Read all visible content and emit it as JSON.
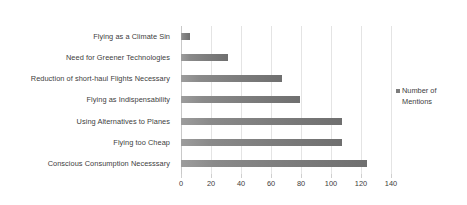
{
  "chart_data": {
    "type": "bar",
    "orientation": "horizontal",
    "title": "",
    "xlabel": "",
    "ylabel": "",
    "xlim": [
      0,
      140
    ],
    "xticks": [
      0,
      20,
      40,
      60,
      80,
      100,
      120,
      140
    ],
    "grid": true,
    "legend_position": "right",
    "categories": [
      "Flying as a Climate Sin",
      "Need for Greener Technologies",
      "Reduction of short-haul Flights Necessary",
      "Flying as Indispensability",
      "Using Alternatives to Planes",
      "Flying too Cheap",
      "Conscious Consumption Necesssary"
    ],
    "series": [
      {
        "name": "Number of Mentions",
        "color": "#7d7d7d",
        "values": [
          6,
          31,
          67,
          79,
          107,
          107,
          124
        ]
      }
    ]
  },
  "legend": {
    "entries": [
      {
        "label": "Number of Mentions",
        "color": "#7d7d7d",
        "marker": "square-marker"
      }
    ]
  },
  "axis": {
    "tick_labels": [
      "0",
      "20",
      "40",
      "60",
      "80",
      "100",
      "120",
      "140"
    ]
  }
}
